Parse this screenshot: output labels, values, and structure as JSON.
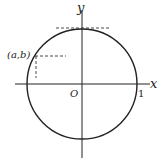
{
  "diagram": {
    "labels": {
      "x_axis": "x",
      "y_axis": "y",
      "origin": "O",
      "radius_tick": "1",
      "point": "(a,b)"
    },
    "elements": [
      "x-axis",
      "y-axis",
      "unit-circle",
      "tangent-dashed-line-top",
      "point-projection-dashed-lines"
    ],
    "stroke_color": "#222222"
  }
}
